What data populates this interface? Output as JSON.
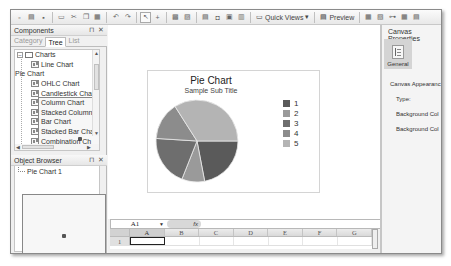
{
  "toolbar": {
    "quick_views_label": "Quick Views",
    "preview_label": "Preview",
    "icons": [
      "new-icon",
      "open-icon",
      "save-icon",
      "print-icon",
      "cut-icon",
      "copy-icon",
      "paste-icon",
      "undo-icon",
      "redo-icon",
      "select-icon",
      "add-icon",
      "bring-front-icon",
      "send-back-icon",
      "align-icon",
      "group-icon",
      "insert-icon",
      "layout-icon"
    ]
  },
  "components": {
    "title": "Components",
    "pin": "⊓",
    "close": "✕",
    "tabs": [
      {
        "label": "Category",
        "active": false
      },
      {
        "label": "Tree",
        "active": true
      },
      {
        "label": "List",
        "active": false
      }
    ],
    "root": {
      "label": "Charts",
      "expander": "−"
    },
    "items": [
      {
        "label": "Line Chart",
        "icon": "line-chart-icon"
      },
      {
        "label": "Pie Chart",
        "icon": "pie-chart-icon"
      },
      {
        "label": "OHLC Chart",
        "icon": "ohlc-chart-icon"
      },
      {
        "label": "Candlestick Char",
        "icon": "candlestick-chart-icon"
      },
      {
        "label": "Column Chart",
        "icon": "column-chart-icon"
      },
      {
        "label": "Stacked Column",
        "icon": "stacked-column-icon"
      },
      {
        "label": "Bar Chart",
        "icon": "bar-chart-icon"
      },
      {
        "label": "Stacked Bar Cha",
        "icon": "stacked-bar-icon"
      },
      {
        "label": "Combination Ch",
        "icon": "combination-chart-icon"
      }
    ]
  },
  "object_browser": {
    "title": "Object Browser",
    "pin": "⊓",
    "close": "✕",
    "items": [
      {
        "label": "Pie Chart 1"
      }
    ]
  },
  "canvas": {
    "chart": {
      "title": "Pie Chart",
      "subtitle": "Sample Sub Title"
    }
  },
  "chart_data": {
    "type": "pie",
    "title": "Pie Chart",
    "subtitle": "Sample Sub Title",
    "categories": [
      "1",
      "2",
      "3",
      "4",
      "5"
    ],
    "values": [
      22,
      9,
      20,
      15,
      34
    ],
    "colors": [
      "#5a5a5a",
      "#9a9a9a",
      "#6e6e6e",
      "#8c8c8c",
      "#b4b4b4"
    ],
    "legend_position": "right"
  },
  "spreadsheet": {
    "name_box": "A1",
    "fx_label": "fx",
    "columns": [
      "A",
      "B",
      "C",
      "D",
      "E",
      "F",
      "G"
    ],
    "rows": [
      "1"
    ]
  },
  "properties": {
    "title": "Canvas Properties",
    "general_label": "General",
    "section": "Canvas Appearanc",
    "fields": [
      {
        "label": "Type:"
      },
      {
        "label": "Background Col"
      },
      {
        "label": "Background Col"
      }
    ]
  }
}
